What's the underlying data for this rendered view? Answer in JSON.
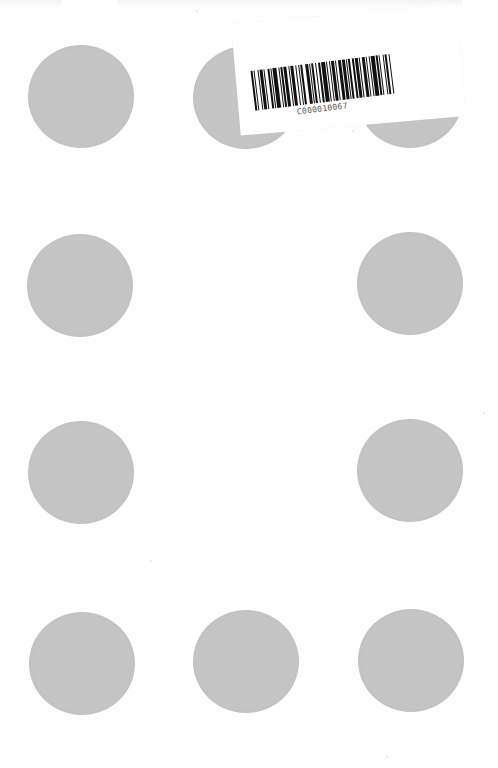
{
  "page": {
    "background": "#fefefe",
    "dot_color": "#c5c5c5",
    "dot_diameter_px": 106
  },
  "dots": [
    {
      "row": 1,
      "col": 1,
      "cx": 81,
      "cy": 96,
      "covered_by_label": false
    },
    {
      "row": 1,
      "col": 2,
      "cx": 246,
      "cy": 97,
      "covered_by_label": true
    },
    {
      "row": 1,
      "col": 3,
      "cx": 410,
      "cy": 96,
      "covered_by_label": true
    },
    {
      "row": 2,
      "col": 1,
      "cx": 80,
      "cy": 285,
      "covered_by_label": false
    },
    {
      "row": 2,
      "col": 3,
      "cx": 410,
      "cy": 283,
      "covered_by_label": false
    },
    {
      "row": 3,
      "col": 1,
      "cx": 81,
      "cy": 472,
      "covered_by_label": false
    },
    {
      "row": 3,
      "col": 3,
      "cx": 410,
      "cy": 470,
      "covered_by_label": false
    },
    {
      "row": 4,
      "col": 1,
      "cx": 82,
      "cy": 663,
      "covered_by_label": false
    },
    {
      "row": 4,
      "col": 2,
      "cx": 246,
      "cy": 661,
      "covered_by_label": false
    },
    {
      "row": 4,
      "col": 3,
      "cx": 411,
      "cy": 660,
      "covered_by_label": false
    }
  ],
  "label": {
    "barcode_text": "C000010067",
    "rotation_deg": -5,
    "bar_pattern": [
      2,
      1,
      1,
      2,
      1,
      1,
      3,
      1,
      1,
      2,
      2,
      1,
      1,
      1,
      3,
      2,
      1,
      1,
      2,
      1,
      2,
      2,
      1,
      1,
      3,
      1,
      1,
      2,
      1,
      1,
      2,
      2,
      3,
      1,
      1,
      1,
      2,
      1,
      1,
      2,
      2,
      1,
      3,
      1,
      1,
      2,
      1,
      1,
      2,
      1,
      1,
      2,
      3,
      1,
      2,
      1,
      1,
      1,
      2,
      2,
      1,
      1,
      3,
      1,
      1,
      2,
      2,
      1,
      1,
      2,
      1,
      1,
      3,
      1,
      2,
      1,
      1,
      2,
      1,
      1,
      2,
      2,
      1,
      1
    ]
  }
}
